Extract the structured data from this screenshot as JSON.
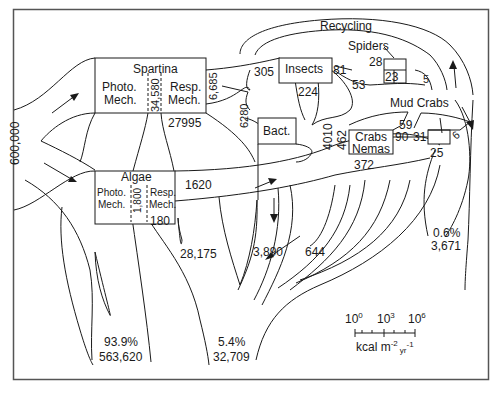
{
  "diagram": {
    "type": "energy-flow",
    "units": "kcal m-2 yr-1",
    "input": {
      "value": "600,000"
    },
    "compartments": {
      "spartina": {
        "label": "Spartina",
        "photo": [
          "Photo.",
          "Mech."
        ],
        "resp": [
          "Resp.",
          "Mech."
        ],
        "gross": "34,580"
      },
      "algae": {
        "label": "Algae",
        "photo": [
          "Photo.",
          "Mech."
        ],
        "resp": [
          "Resp.",
          "Mech."
        ],
        "gross": "1,800"
      },
      "insects": {
        "label": "Insects"
      },
      "spiders": {
        "label": "Spiders"
      },
      "bacteria": {
        "label": "Bact."
      },
      "crabs_nemas": {
        "label1": "Crabs",
        "label2": "Nemas"
      },
      "mud_crabs": {
        "label": "Mud Crabs"
      }
    },
    "flows": {
      "spartina_resp": "27995",
      "spartina_out": "6,685",
      "spartina_to_bact": "6280",
      "to_insects": "305",
      "insects_resp": "224",
      "insects_out": "81",
      "insects_to_detritus": "53",
      "spiders_in": "28",
      "spiders_resp": "23",
      "spiders_out": "5",
      "algae_resp": "180",
      "algae_net": "1620",
      "detritus_4010": "4010",
      "detritus_462": "462",
      "crabs_resp": "372",
      "mudcrabs_in": "59",
      "mudcrabs_90": "90",
      "mudcrabs_31": "31",
      "mudcrabs_resp": "25",
      "mudcrabs_out": "6",
      "heat_28175": "28,175",
      "heat_3890": "3,890",
      "heat_644": "644"
    },
    "recycling_label": "Recycling",
    "outputs": {
      "reflected": {
        "pct": "93.9%",
        "value": "563,620"
      },
      "middle": {
        "pct": "5.4%",
        "value": "32,709"
      },
      "export": {
        "pct": "0.6%",
        "value": "3,671"
      }
    },
    "scale": {
      "ticks": [
        "10",
        "10",
        "10"
      ],
      "exponents": [
        "0",
        "3",
        "6"
      ],
      "unit_main": "kcal m",
      "unit_exp1": "-2",
      "unit_sub": "yr",
      "unit_exp2": "-1"
    }
  }
}
